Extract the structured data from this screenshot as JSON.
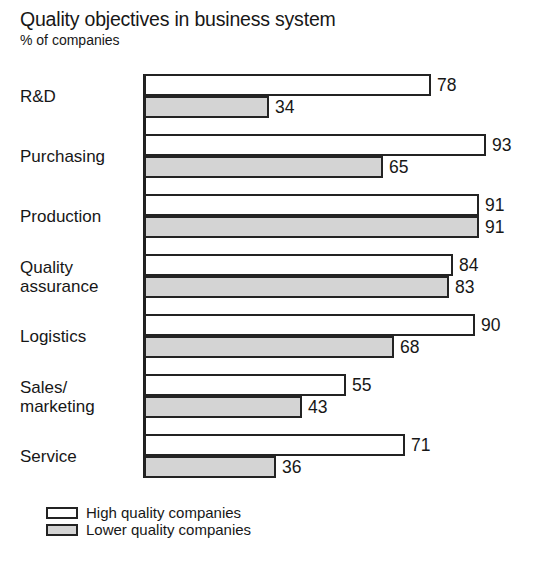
{
  "chart_data": {
    "type": "bar",
    "orientation": "horizontal",
    "title": "Quality objectives in business system",
    "subtitle": "% of companies",
    "xlabel": "",
    "ylabel": "",
    "xlim": [
      0,
      100
    ],
    "grid": false,
    "legend_position": "bottom-left",
    "categories": [
      "R&D",
      "Purchasing",
      "Production",
      "Quality\nassurance",
      "Logistics",
      "Sales/\nmarketing",
      "Service"
    ],
    "series": [
      {
        "name": "High quality companies",
        "color": "#ffffff",
        "values": [
          78,
          93,
          91,
          84,
          90,
          55,
          71
        ]
      },
      {
        "name": "Lower quality companies",
        "color": "#d4d4d4",
        "values": [
          34,
          65,
          91,
          83,
          68,
          43,
          36
        ]
      }
    ]
  },
  "legend": {
    "items": [
      {
        "label": "High quality companies",
        "swatch": "high"
      },
      {
        "label": "Lower quality companies",
        "swatch": "low"
      }
    ]
  }
}
